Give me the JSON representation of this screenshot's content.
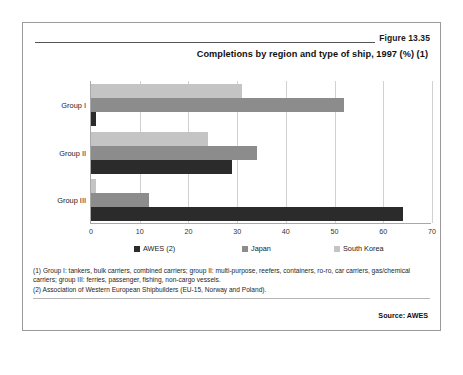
{
  "figure": {
    "number_label": "Figure 13.35",
    "source_label": "Source: AWES"
  },
  "chart_data": {
    "type": "bar",
    "orientation": "horizontal",
    "title": "Completions by region and type of ship, 1997 (%) (1)",
    "xlabel": "",
    "ylabel": "",
    "categories": [
      "Group I",
      "Group II",
      "Group III"
    ],
    "series": [
      {
        "name": "AWES (2)",
        "color": "#2b2b2b",
        "values": [
          1,
          29,
          64
        ]
      },
      {
        "name": "Japan",
        "color": "#8c8c8c",
        "values": [
          52,
          34,
          12
        ]
      },
      {
        "name": "South Korea",
        "color": "#c4c4c4",
        "values": [
          31,
          24,
          1
        ]
      }
    ],
    "xlim": [
      0,
      70
    ],
    "xticks": [
      0,
      10,
      20,
      30,
      40,
      50,
      60,
      70
    ],
    "xtick_labels": [
      "0",
      "10",
      "20",
      "30",
      "40",
      "50",
      "60",
      "70"
    ],
    "grid": true,
    "legend_position": "bottom"
  },
  "footnotes": {
    "note1": "(1) Group I: tankers, bulk carriers, combined carriers; group II: multi-purpose, reefers, containers, ro-ro, car carriers, gas/chemical carriers; group III: ferries, passenger, fishing, non-cargo vessels.",
    "note2": "(2) Association of Western European Shipbuilders (EU-15, Norway and Poland)."
  }
}
